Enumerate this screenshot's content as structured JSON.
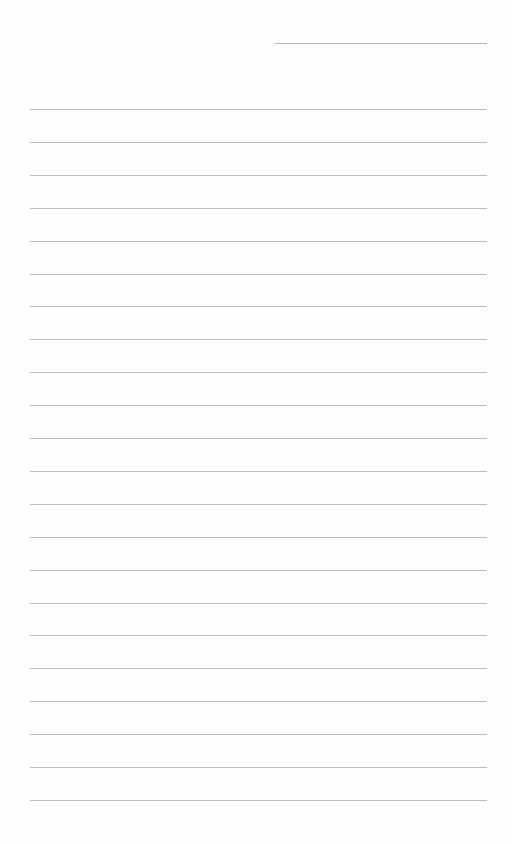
{
  "document": {
    "type": "lined-paper",
    "header_line": {
      "x_start": 275,
      "x_end": 487,
      "y": 43
    },
    "rules": {
      "count": 22,
      "first_y": 109,
      "spacing": 32.9,
      "x_start": 30,
      "x_end": 487,
      "color": "#bdbdbd"
    },
    "background_color": "#ffffff"
  }
}
